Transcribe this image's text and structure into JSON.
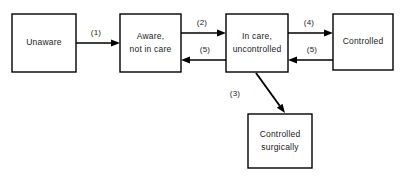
{
  "diagram": {
    "type": "flow-diagram",
    "background_color": "#ffffff",
    "stroke_color": "#000000",
    "text_color": "#1a1a1a",
    "nodes": [
      {
        "id": "unaware",
        "name": "unaware",
        "lines": [
          "Unaware"
        ],
        "x": 12,
        "y": 14,
        "w": 64,
        "h": 58
      },
      {
        "id": "aware-not-in-care",
        "name": "aware-not-in-care",
        "lines": [
          "Aware,",
          "not in care"
        ],
        "x": 120,
        "y": 14,
        "w": 61,
        "h": 58
      },
      {
        "id": "in-care-uncontrolled",
        "name": "in-care-uncontrolled",
        "lines": [
          "In care,",
          "uncontrolled"
        ],
        "x": 226,
        "y": 14,
        "w": 62,
        "h": 58
      },
      {
        "id": "controlled",
        "name": "controlled",
        "lines": [
          "Controlled"
        ],
        "x": 333,
        "y": 14,
        "w": 60,
        "h": 56
      },
      {
        "id": "controlled-surgically",
        "name": "controlled-surgically",
        "lines": [
          "Controlled",
          "surgically"
        ],
        "x": 248,
        "y": 114,
        "w": 64,
        "h": 54
      }
    ],
    "edges": [
      {
        "id": "edge-1",
        "name": "edge-unaware-to-aware",
        "label": "(1)",
        "from": "unaware",
        "to": "aware-not-in-care",
        "orientation": "horizontal",
        "direction": "right",
        "x1": 76,
        "y1": 43,
        "x2": 120,
        "y2": 43,
        "label_x": 96,
        "label_y": 35
      },
      {
        "id": "edge-2",
        "name": "edge-aware-to-in-care",
        "label": "(2)",
        "from": "aware-not-in-care",
        "to": "in-care-uncontrolled",
        "orientation": "horizontal",
        "direction": "right",
        "x1": 181,
        "y1": 33,
        "x2": 226,
        "y2": 33,
        "label_x": 202,
        "label_y": 25
      },
      {
        "id": "edge-5a",
        "name": "edge-in-care-to-aware",
        "label": "(5)",
        "from": "in-care-uncontrolled",
        "to": "aware-not-in-care",
        "orientation": "horizontal",
        "direction": "left",
        "x1": 226,
        "y1": 60,
        "x2": 181,
        "y2": 60,
        "label_x": 205,
        "label_y": 52
      },
      {
        "id": "edge-4",
        "name": "edge-in-care-to-controlled",
        "label": "(4)",
        "from": "in-care-uncontrolled",
        "to": "controlled",
        "orientation": "horizontal",
        "direction": "right",
        "x1": 288,
        "y1": 33,
        "x2": 333,
        "y2": 33,
        "label_x": 309,
        "label_y": 25
      },
      {
        "id": "edge-5b",
        "name": "edge-controlled-to-in-care",
        "label": "(5)",
        "from": "controlled",
        "to": "in-care-uncontrolled",
        "orientation": "horizontal",
        "direction": "left",
        "x1": 333,
        "y1": 60,
        "x2": 288,
        "y2": 60,
        "label_x": 312,
        "label_y": 52
      },
      {
        "id": "edge-3",
        "name": "edge-in-care-to-controlled-surgically",
        "label": "(3)",
        "from": "in-care-uncontrolled",
        "to": "controlled-surgically",
        "orientation": "diagonal",
        "direction": "down-right",
        "x1": 256,
        "y1": 73,
        "x2": 285,
        "y2": 113,
        "label_x": 235,
        "label_y": 96
      }
    ]
  }
}
